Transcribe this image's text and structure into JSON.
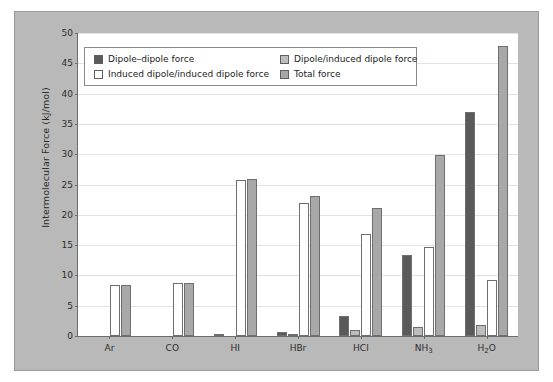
{
  "chart_data": {
    "type": "bar",
    "title": "",
    "xlabel": "",
    "ylabel": "Intermolecular Force (kJ/mol)",
    "ylim": [
      0,
      50
    ],
    "yticks": [
      0,
      5,
      10,
      15,
      20,
      25,
      30,
      35,
      40,
      45,
      50
    ],
    "grid": true,
    "legend_position": "upper-left-inside",
    "categories": [
      "Ar",
      "CO",
      "HI",
      "HBr",
      "HCl",
      "NH3",
      "H2O"
    ],
    "category_labels_html": [
      "Ar",
      "CO",
      "HI",
      "HBr",
      "HCl",
      "NH<sub>3</sub>",
      "H<sub>2</sub>O"
    ],
    "series": [
      {
        "name": "Dipole–dipole force",
        "color": "#5a5a5a",
        "values": [
          0,
          0,
          0.025,
          0.69,
          3.3,
          13.3,
          36.9
        ]
      },
      {
        "name": "Dipole/induced dipole force",
        "color": "#bdbdbd",
        "values": [
          0,
          0,
          0.0,
          0.1,
          1.0,
          1.5,
          1.9
        ]
      },
      {
        "name": "Induced dipole/induced dipole force",
        "color": "#ffffff",
        "values": [
          8.4,
          8.7,
          25.8,
          21.9,
          16.8,
          14.7,
          9.2
        ]
      },
      {
        "name": "Total force",
        "color": "#a8a8a8",
        "values": [
          8.4,
          8.7,
          25.9,
          23.1,
          21.1,
          29.8,
          47.8
        ]
      }
    ]
  },
  "legend": {
    "entries": [
      {
        "label": "Dipole–dipole force",
        "color": "#5a5a5a"
      },
      {
        "label": "Dipole/induced dipole force",
        "color": "#bdbdbd"
      },
      {
        "label": "Induced dipole/induced dipole force",
        "color": "#ffffff"
      },
      {
        "label": "Total force",
        "color": "#a8a8a8"
      }
    ]
  },
  "figure": {
    "background_color": "#b9b9b9",
    "plot_background_color": "#ffffff",
    "axis_color": "#6d6d6d",
    "grid_color": "#e2e2e2"
  }
}
